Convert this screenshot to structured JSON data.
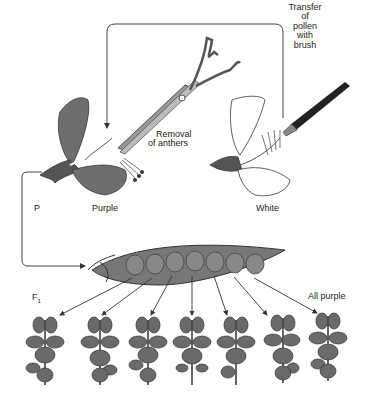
{
  "labels": {
    "transfer": [
      "Transfer",
      "of",
      "pollen",
      "with",
      "brush"
    ],
    "removal": [
      "Removal",
      "of anthers"
    ],
    "p": "P",
    "purple": "Purple",
    "white": "White",
    "f1": "F",
    "f1_sub": "1",
    "all_purple": "All purple"
  },
  "colors": {
    "purple_fill": "#6e6e6e",
    "pod_fill": "#777777",
    "line": "#333333"
  },
  "plants_count": 7,
  "peas_count": 7
}
